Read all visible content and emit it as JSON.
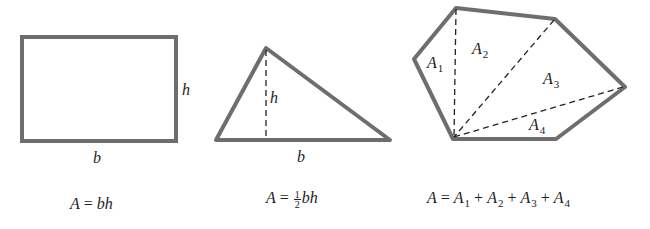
{
  "colors": {
    "shape_stroke": "#6e6e6e",
    "dashed_line": "#222222",
    "text": "#222222",
    "background": "#ffffff"
  },
  "figures": [
    {
      "name": "rectangle",
      "labels": {
        "base": "b",
        "height": "h"
      },
      "formula": {
        "lhs": "A",
        "eq": "=",
        "rhs": "bh"
      }
    },
    {
      "name": "triangle",
      "labels": {
        "base": "b",
        "height": "h"
      },
      "formula": {
        "lhs": "A",
        "eq": "=",
        "frac_num": "1",
        "frac_den": "2",
        "rhs": "bh"
      }
    },
    {
      "name": "polygon",
      "labels": {
        "regions": [
          {
            "sym": "A",
            "sub": "1"
          },
          {
            "sym": "A",
            "sub": "2"
          },
          {
            "sym": "A",
            "sub": "3"
          },
          {
            "sym": "A",
            "sub": "4"
          }
        ]
      },
      "formula": {
        "lhs": "A",
        "eq": "=",
        "terms": [
          {
            "sym": "A",
            "sub": "1"
          },
          {
            "sym": "A",
            "sub": "2"
          },
          {
            "sym": "A",
            "sub": "3"
          },
          {
            "sym": "A",
            "sub": "4"
          }
        ],
        "op": "+"
      }
    }
  ]
}
